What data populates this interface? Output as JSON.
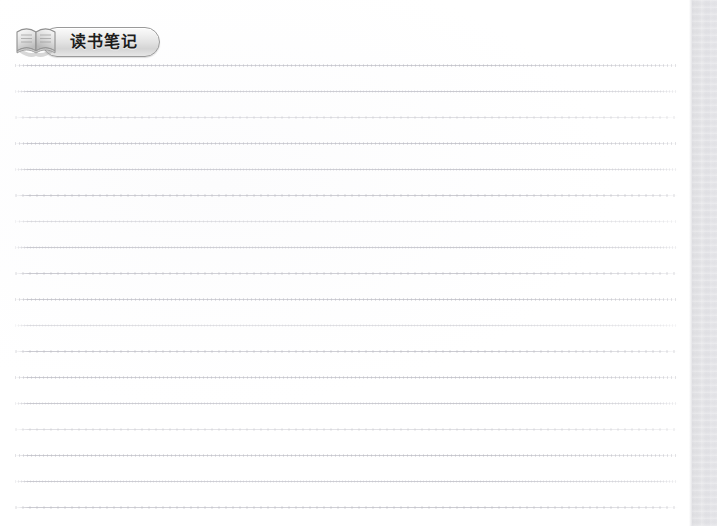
{
  "document": {
    "kind": "scanned-notebook-page",
    "page_background": "#ffffff",
    "rule_color": "#cbcbd2",
    "gutter_color": "#e4e4e8"
  },
  "header": {
    "badge_label": "读书笔记",
    "badge_fill_top": "#fbfbfb",
    "badge_fill_bottom": "#d4d4d4",
    "badge_border": "#9a9a9a",
    "text_color": "#1d1d1d",
    "icon": {
      "name": "open-book-icon",
      "color_light": "#f2f2f2",
      "color_mid": "#c9c9c9",
      "color_dark": "#8e8e8e"
    }
  },
  "ruled_lines": {
    "count": 18,
    "x_start": 15,
    "x_end": 678,
    "pitch": 26,
    "y_positions": [
      65,
      91,
      117,
      143,
      169,
      195,
      221,
      247,
      273,
      299,
      325,
      351,
      377,
      403,
      429,
      455,
      481,
      507
    ]
  },
  "gutter": {
    "x": 692,
    "width": 25,
    "label": "page-gutter-shadow"
  }
}
